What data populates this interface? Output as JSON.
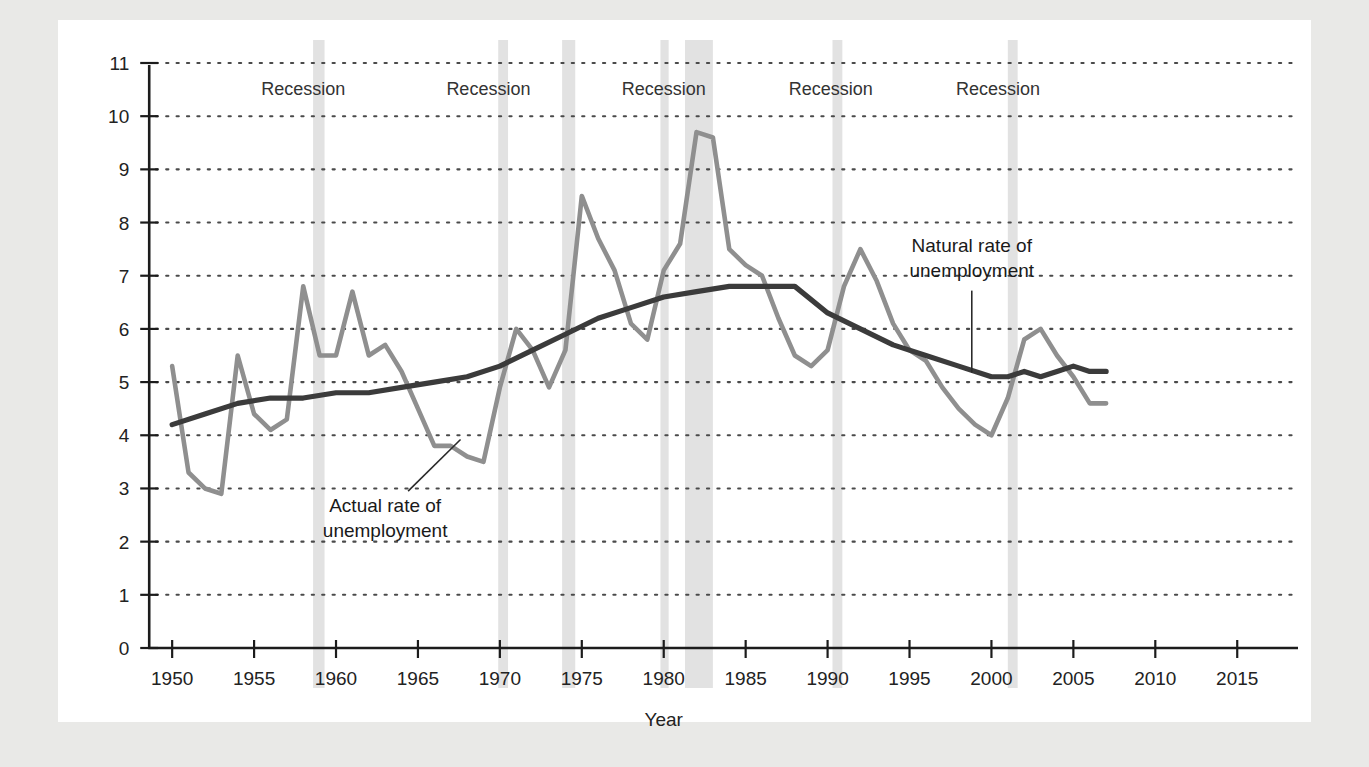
{
  "chart_data": {
    "type": "line",
    "title": "",
    "xlabel": "Year",
    "ylabel": "",
    "xlim": [
      1947,
      2017
    ],
    "ylim": [
      0,
      11
    ],
    "grid": true,
    "legend": "none",
    "x_ticks": [
      1950,
      1955,
      1960,
      1965,
      1970,
      1975,
      1980,
      1985,
      1990,
      1995,
      2000,
      2005,
      2010,
      2015
    ],
    "y_ticks": [
      0,
      1,
      2,
      3,
      4,
      5,
      6,
      7,
      8,
      9,
      10,
      11
    ],
    "series": [
      {
        "name": "Actual rate of unemployment",
        "color": "#8f8f8f",
        "x": [
          1950,
          1951,
          1952,
          1953,
          1954,
          1955,
          1956,
          1957,
          1958,
          1959,
          1960,
          1961,
          1962,
          1963,
          1964,
          1965,
          1966,
          1967,
          1968,
          1969,
          1970,
          1971,
          1972,
          1973,
          1974,
          1975,
          1976,
          1977,
          1978,
          1979,
          1980,
          1981,
          1982,
          1983,
          1984,
          1985,
          1986,
          1987,
          1988,
          1989,
          1990,
          1991,
          1992,
          1993,
          1994,
          1995,
          1996,
          1997,
          1998,
          1999,
          2000,
          2001,
          2002,
          2003,
          2004,
          2005,
          2006,
          2007
        ],
        "values": [
          5.3,
          3.3,
          3.0,
          2.9,
          5.5,
          4.4,
          4.1,
          4.3,
          6.8,
          5.5,
          5.5,
          6.7,
          5.5,
          5.7,
          5.2,
          4.5,
          3.8,
          3.8,
          3.6,
          3.5,
          4.9,
          6.0,
          5.6,
          4.9,
          5.6,
          8.5,
          7.7,
          7.1,
          6.1,
          5.8,
          7.1,
          7.6,
          9.7,
          9.6,
          7.5,
          7.2,
          7.0,
          6.2,
          5.5,
          5.3,
          5.6,
          6.8,
          7.5,
          6.9,
          6.1,
          5.6,
          5.4,
          4.9,
          4.5,
          4.2,
          4.0,
          4.7,
          5.8,
          6.0,
          5.5,
          5.1,
          4.6,
          4.6
        ]
      },
      {
        "name": "Natural rate of unemployment",
        "color": "#3b3b3b",
        "x": [
          1950,
          1952,
          1954,
          1956,
          1958,
          1960,
          1962,
          1964,
          1966,
          1968,
          1970,
          1972,
          1974,
          1976,
          1978,
          1980,
          1982,
          1984,
          1986,
          1988,
          1990,
          1992,
          1994,
          1996,
          1998,
          2000,
          2001,
          2002,
          2003,
          2004,
          2005,
          2006,
          2007
        ],
        "values": [
          4.2,
          4.4,
          4.6,
          4.7,
          4.7,
          4.8,
          4.8,
          4.9,
          5.0,
          5.1,
          5.3,
          5.6,
          5.9,
          6.2,
          6.4,
          6.6,
          6.7,
          6.8,
          6.8,
          6.8,
          6.3,
          6.0,
          5.7,
          5.5,
          5.3,
          5.1,
          5.1,
          5.2,
          5.1,
          5.2,
          5.3,
          5.2,
          5.2
        ]
      }
    ],
    "recession_bands": [
      {
        "start": 1958.6,
        "end": 1959.3,
        "label": "Recession"
      },
      {
        "start": 1969.9,
        "end": 1970.5,
        "label": "Recession"
      },
      {
        "start": 1973.8,
        "end": 1974.6,
        "label": "Recession"
      },
      {
        "start": 1979.8,
        "end": 1980.3,
        "label": "Recession"
      },
      {
        "start": 1981.3,
        "end": 1983.0,
        "label": "Recession"
      },
      {
        "start": 1990.3,
        "end": 1990.9,
        "label": "Recession"
      },
      {
        "start": 2001.0,
        "end": 2001.6,
        "label": "Recession"
      }
    ],
    "recession_labels": [
      {
        "text": "Recession",
        "x": 1958.0
      },
      {
        "text": "Recession",
        "x": 1969.3
      },
      {
        "text": "Recession",
        "x": 1980.0
      },
      {
        "text": "Recession",
        "x": 1990.2
      },
      {
        "text": "Recession",
        "x": 2000.4
      }
    ],
    "annotations": [
      {
        "id": "actual-annotation",
        "line1": "Actual rate of",
        "line2": "unemployment",
        "text_x": 1963.0,
        "text_y": 2.55,
        "leader_from": [
          1964.4,
          2.95
        ],
        "leader_to": [
          1967.6,
          3.92
        ]
      },
      {
        "id": "natural-annotation",
        "line1": "Natural rate of",
        "line2": "unemployment",
        "text_x": 1998.8,
        "text_y": 7.45,
        "leader_from": [
          1998.8,
          6.72
        ],
        "leader_to": [
          1998.8,
          5.18
        ]
      }
    ],
    "colors": {
      "actual_line": "#8f8f8f",
      "natural_line": "#3b3b3b",
      "recession_band": "#e2e2e2",
      "grid_dots": "#4a4a4a",
      "axis": "#1c1c1c",
      "plate_background": "#ffffff",
      "page_background": "#e9e9e7"
    }
  }
}
